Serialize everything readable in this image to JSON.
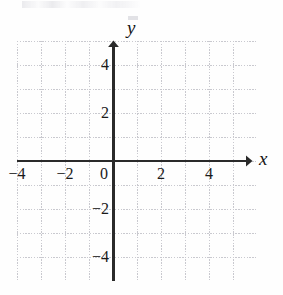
{
  "figure": {
    "kind": "cartesian-coordinate-plane",
    "title": "",
    "background_color": "#fefefe"
  },
  "chart_data": {
    "type": "scatter",
    "title": "",
    "subtitle": "",
    "xlabel": "x",
    "ylabel": "y",
    "xlim": [
      -5,
      5
    ],
    "ylim": [
      -5,
      5
    ],
    "x_tick_values": [
      -4,
      -2,
      0,
      2,
      4
    ],
    "y_tick_values": [
      4,
      2,
      0,
      -2,
      -4
    ],
    "x_tick_labels": [
      "−4",
      "−2",
      "0",
      "2",
      "4"
    ],
    "y_tick_labels": [
      "4",
      "2",
      "0",
      "−2",
      "−4"
    ],
    "grid": true,
    "grid_spacing": 1,
    "grid_style": "dotted",
    "grid_color": "#c9c9cf",
    "axis_color": "#2a2a2a",
    "legend": null,
    "series": [],
    "annotations": [],
    "note": "Empty blank coordinate grid; no data points or curves plotted."
  },
  "axes": {
    "x_axis_label": "x",
    "y_axis_label": "y",
    "origin_label": "0",
    "x_arrow": "right-arrowhead",
    "y_arrow": "up-arrowhead"
  },
  "ticks": {
    "x": [
      {
        "label": "−4",
        "value": -4
      },
      {
        "label": "−2",
        "value": -2
      },
      {
        "label": "0",
        "value": 0
      },
      {
        "label": "2",
        "value": 2
      },
      {
        "label": "4",
        "value": 4
      }
    ],
    "y": [
      {
        "label": "4",
        "value": 4
      },
      {
        "label": "2",
        "value": 2
      },
      {
        "label": "−2",
        "value": -2
      },
      {
        "label": "−4",
        "value": -4
      }
    ]
  },
  "colors": {
    "grid": "#c9c9cf",
    "axis": "#2a2a2a",
    "text": "#1a1a1a",
    "background": "#fefefe"
  }
}
